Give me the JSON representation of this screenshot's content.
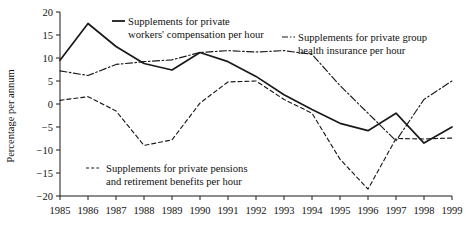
{
  "chart_data": {
    "type": "line",
    "title": "",
    "xlabel": "",
    "ylabel": "Percentage per annum",
    "x": [
      1985,
      1986,
      1987,
      1988,
      1989,
      1990,
      1991,
      1992,
      1993,
      1994,
      1995,
      1996,
      1997,
      1998,
      1999
    ],
    "categories": [
      "1985",
      "1986",
      "1987",
      "1988",
      "1989",
      "1990",
      "1991",
      "1992",
      "1993",
      "1994",
      "1995",
      "1996",
      "1997",
      "1998",
      "1999"
    ],
    "xlim": [
      1985,
      1999
    ],
    "ylim": [
      -20,
      20
    ],
    "yticks": [
      -20,
      -15,
      -10,
      -5,
      0,
      5,
      10,
      15,
      20
    ],
    "ytick_labels": [
      "−20",
      "−15",
      "−10",
      "−5",
      "0",
      "5",
      "10",
      "15",
      "20"
    ],
    "grid": false,
    "legend_position": "inside",
    "series": [
      {
        "name": "Supplements for private workers' compensation per hour",
        "style": "solid",
        "color": "#1a1a1a",
        "values": [
          9.5,
          17.5,
          12.5,
          8.8,
          7.4,
          11.2,
          9.2,
          6.0,
          2.0,
          -1.2,
          -4.2,
          -5.8,
          -2.0,
          -8.5,
          -5.0
        ]
      },
      {
        "name": "Supplements for private group health insurance per hour",
        "style": "dashdot",
        "color": "#1a1a1a",
        "values": [
          7.2,
          6.2,
          8.6,
          9.2,
          9.6,
          11.2,
          11.6,
          11.3,
          11.6,
          10.8,
          4.0,
          -2.0,
          -8.0,
          1.0,
          5.0
        ]
      },
      {
        "name": "Supplements for private pensions and retirement benefits per hour",
        "style": "dashed",
        "color": "#1a1a1a",
        "values": [
          0.8,
          1.6,
          -1.5,
          -9.0,
          -7.8,
          0.2,
          4.8,
          5.0,
          1.0,
          -2.0,
          -12.0,
          -18.5,
          -7.5,
          -7.6,
          -7.4
        ]
      }
    ],
    "legend": [
      {
        "key": "solid",
        "lines": [
          "Supplements for private",
          "workers' compensation per hour"
        ]
      },
      {
        "key": "dashdot",
        "lines": [
          "Supplements for private group",
          "health insurance per hour"
        ]
      },
      {
        "key": "dashed",
        "lines": [
          "Supplements for private pensions",
          "and retirement benefits per hour"
        ]
      }
    ]
  },
  "axis": {
    "y_title": "Percentage per annum"
  }
}
